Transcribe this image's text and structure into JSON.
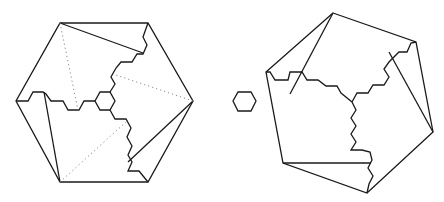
{
  "figure": {
    "colors": {
      "stroke": "#1a1a1a",
      "dotted": "#8a8a8a",
      "background": "#ffffff"
    },
    "left_hexagon": {
      "outline": "60,23 148,23 193,101 148,182 60,182 16,101",
      "center_hex": "100,92 110,92 115,101 110,110 100,110 95,101",
      "arm_left": "95,101 84,101 79,110 68,110 63,101 51,101 46,94 43,92 33,92 28,101 16,101",
      "arm_up": "110,92 115,84 111,77 116,68 121,62 132,62 137,54 143,54 147,45 143,37 148,23",
      "arm_down": "110,110 115,119 126,119 131,128 127,137 132,146 128,155 132,162 128,171 139,171 148,182",
      "folds": [
        "60,23 143,53",
        "193,101 128,162",
        "44,92 60,182"
      ],
      "dotted": [
        "60,23 78,110",
        "193,101 116,75",
        "60,182 126,122"
      ]
    },
    "small_hexagon": "238,92 251,92 256,101 251,111 238,111 233,101",
    "right_hexagon": {
      "outline": "333,13 416,42 433,132 367,193 283,163 266,72",
      "arm_left": "352,102 341,93 337,86 326,86 318,80 307,80 302,72 290,72 288,80 275,80 270,72 266,72",
      "arm_up": "352,102 357,93 368,93 373,85 384,85 389,77 384,69 389,62 399,52 407,52 411,43 416,42",
      "arm_down": "352,102 356,110 351,118 356,126 351,134 356,142 351,150 362,150 370,152 372,160 368,168 373,176 369,184 367,193",
      "folds": [
        "333,13 290,94",
        "389,52 433,132",
        "283,163 371,163"
      ]
    }
  }
}
